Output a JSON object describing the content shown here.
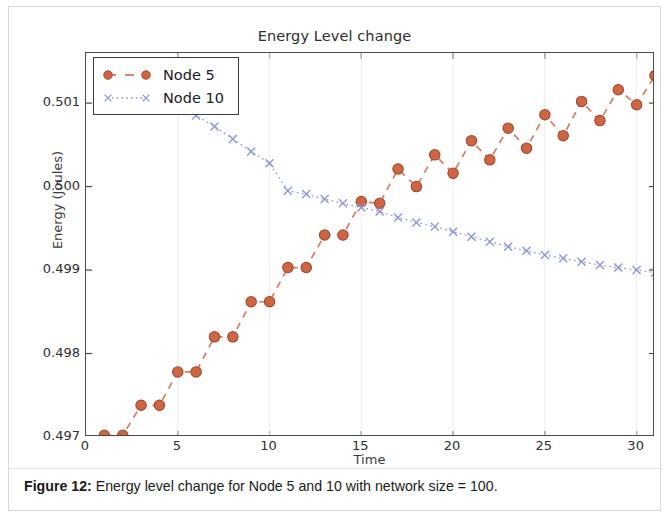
{
  "figure": {
    "caption_label": "Figure 12:",
    "caption_text": " Energy level change for Node 5 and 10 with network size = 100."
  },
  "chart_data": {
    "type": "line",
    "title": "Energy Level change",
    "xlabel": "Time",
    "ylabel": "Energy (Joules)",
    "xlim": [
      0,
      31
    ],
    "ylim": [
      0.497,
      0.5016
    ],
    "xticks": [
      0,
      5,
      10,
      15,
      20,
      25,
      30
    ],
    "xticklabels": [
      "0",
      "5",
      "10",
      "15",
      "20",
      "25",
      "30"
    ],
    "yticks": [
      0.497,
      0.498,
      0.499,
      0.5,
      0.501
    ],
    "yticklabels": [
      "0.497",
      "0.498",
      "0.499",
      "0.500",
      "0.501"
    ],
    "grid": false,
    "legend_position": "upper left",
    "series": [
      {
        "name": "Node 5",
        "color": "#cc6644",
        "marker": "o",
        "linestyle": "dashed",
        "x": [
          1,
          2,
          3,
          4,
          5,
          6,
          7,
          8,
          9,
          10,
          11,
          12,
          13,
          14,
          15,
          16,
          17,
          18,
          19,
          20,
          21,
          22,
          23,
          24,
          25,
          26,
          27,
          28,
          29,
          30,
          31
        ],
        "y": [
          0.49702,
          0.49702,
          0.49738,
          0.49738,
          0.49778,
          0.49778,
          0.4982,
          0.4982,
          0.49862,
          0.49862,
          0.49903,
          0.49903,
          0.49942,
          0.49942,
          0.49982,
          0.4998,
          0.50021,
          0.5,
          0.50038,
          0.50016,
          0.50055,
          0.50032,
          0.5007,
          0.50046,
          0.50086,
          0.50061,
          0.50102,
          0.50079,
          0.50116,
          0.50098,
          0.50133
        ]
      },
      {
        "name": "Node 10",
        "color": "#8d97da",
        "marker": "x",
        "linestyle": "dotted",
        "x": [
          1,
          2,
          3,
          4,
          5,
          6,
          7,
          8,
          9,
          10,
          11,
          12,
          13,
          14,
          15,
          16,
          17,
          18,
          19,
          20,
          21,
          22,
          23,
          24,
          25,
          26,
          27,
          28,
          29,
          30,
          31
        ],
        "y": [
          0.50146,
          0.50134,
          0.50122,
          0.5011,
          0.50098,
          0.50085,
          0.50072,
          0.50057,
          0.50042,
          0.50028,
          0.49995,
          0.49991,
          0.49985,
          0.4998,
          0.49975,
          0.4997,
          0.49963,
          0.49957,
          0.49952,
          0.49946,
          0.4994,
          0.49934,
          0.49928,
          0.49923,
          0.49918,
          0.49914,
          0.4991,
          0.49906,
          0.49903,
          0.499,
          0.49897
        ]
      }
    ],
    "legend_entries": [
      {
        "label": "Node 5",
        "color": "#cc6644",
        "marker": "circle",
        "linestyle": "dashed"
      },
      {
        "label": "Node 10",
        "color": "#8d97da",
        "marker": "cross",
        "linestyle": "dotted"
      }
    ]
  }
}
